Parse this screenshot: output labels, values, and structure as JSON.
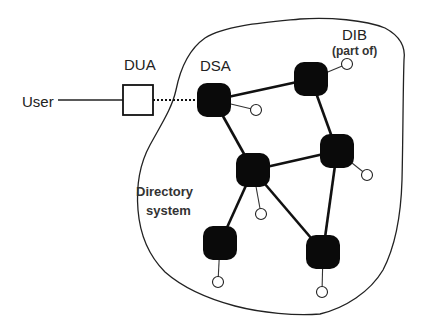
{
  "diagram": {
    "colors": {
      "background": "#ffffff",
      "ink": "#111111",
      "node_fill": "#0a0a0a",
      "dib_fill": "#ffffff"
    },
    "labels": {
      "user": "User",
      "dua": "DUA",
      "dsa": "DSA",
      "dib": "DIB",
      "dib_sub": "(part of)",
      "system_line1": "Directory",
      "system_line2": "system"
    },
    "user": {
      "label_x": 22,
      "label_y": 107,
      "line_from": [
        58,
        100
      ],
      "line_to": [
        123,
        100
      ]
    },
    "dua": {
      "x": 123,
      "y": 85,
      "w": 30,
      "h": 30,
      "label_x": 124,
      "label_y": 70
    },
    "dua_to_dsa": {
      "from": [
        153,
        100
      ],
      "to": [
        197,
        100
      ],
      "style": "dotted"
    },
    "dsa_nodes": [
      {
        "id": "n1",
        "cx": 214,
        "cy": 100,
        "size": 34,
        "dib": [
          256,
          110
        ],
        "is_entry": true
      },
      {
        "id": "n2",
        "cx": 311,
        "cy": 79,
        "size": 34,
        "dib": [
          347,
          64
        ]
      },
      {
        "id": "n3",
        "cx": 253,
        "cy": 170,
        "size": 34,
        "dib": [
          261,
          214
        ]
      },
      {
        "id": "n4",
        "cx": 337,
        "cy": 151,
        "size": 34,
        "dib": [
          367,
          175
        ]
      },
      {
        "id": "n5",
        "cx": 220,
        "cy": 243,
        "size": 34,
        "dib": [
          218,
          282
        ]
      },
      {
        "id": "n6",
        "cx": 323,
        "cy": 252,
        "size": 34,
        "dib": [
          322,
          292
        ]
      }
    ],
    "links": [
      [
        "n1",
        "n2"
      ],
      [
        "n1",
        "n3"
      ],
      [
        "n2",
        "n4"
      ],
      [
        "n3",
        "n4"
      ],
      [
        "n3",
        "n5"
      ],
      [
        "n3",
        "n6"
      ],
      [
        "n4",
        "n6"
      ]
    ],
    "dsa_label_pos": [
      200,
      71
    ],
    "dib_label_pos": [
      342,
      40
    ],
    "dib_sub_pos": [
      332,
      55
    ],
    "system_label_pos": [
      [
        136,
        196
      ],
      [
        146,
        215
      ]
    ],
    "boundary_path": "M 205 38 C 225 25, 270 22, 300 19 C 330 17, 365 20, 385 28 C 400 36, 406 46, 404 60 C 403 90, 403 140, 402 180 C 401 215, 396 245, 383 270 C 370 292, 345 308, 320 314 C 295 316, 262 313, 235 306 C 205 298, 182 287, 165 272 C 148 255, 140 235, 138 210 C 136 185, 139 165, 150 145 C 162 123, 172 108, 176 90 C 180 70, 188 50, 205 38 Z"
  }
}
